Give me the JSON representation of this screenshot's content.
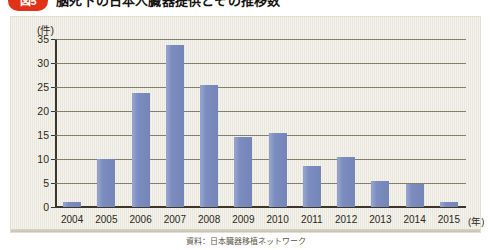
{
  "header": {
    "badge_label": "図5",
    "title": "脳死下の日本人臓器提供とその推移数"
  },
  "figure": {
    "y_unit": "(件)",
    "x_unit": "(年)"
  },
  "source": {
    "caption": "資料：日本臓器移植ネットワーク"
  },
  "chart_data": {
    "type": "bar",
    "title": "脳死下の日本人臓器提供とその推移数",
    "xlabel": "(年)",
    "ylabel": "(件)",
    "ylim": [
      0,
      35
    ],
    "ytick_step": 5,
    "yticks": [
      0,
      5,
      10,
      15,
      20,
      25,
      30,
      35
    ],
    "grid": true,
    "legend": "none",
    "bar_color": "#7b8cc0",
    "plot_background": "#eceade",
    "categories": [
      "2004",
      "2005",
      "2006",
      "2007",
      "2008",
      "2009",
      "2010",
      "2011",
      "2012",
      "2013",
      "2014",
      "2015"
    ],
    "values": [
      1,
      10,
      23.8,
      33.8,
      25.5,
      14.5,
      15.5,
      8.5,
      10.5,
      5.5,
      4.7,
      1
    ]
  }
}
